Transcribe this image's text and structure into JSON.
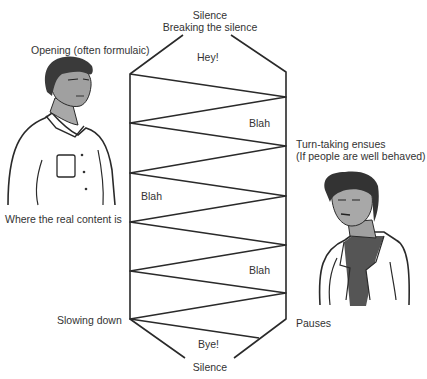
{
  "diagram": {
    "top_labels": {
      "silence": "Silence",
      "breaking": "Breaking the silence"
    },
    "left_labels": {
      "opening": "Opening (often formulaic)",
      "real_content": "Where the real content is",
      "slowing_down": "Slowing down"
    },
    "right_labels": {
      "turn_taking_line1": "Turn-taking ensues",
      "turn_taking_line2": "(If people are well behaved)",
      "pauses": "Pauses"
    },
    "utterances": {
      "hey": "Hey!",
      "blah1": "Blah",
      "blah2": "Blah",
      "blah3": "Blah",
      "bye": "Bye!"
    },
    "bottom_label": "Silence",
    "caption_fragment": "... of the conversation ...",
    "figures": {
      "left": "man-illustration",
      "right": "woman-illustration"
    },
    "colors": {
      "line": "#2a2a2a",
      "skin_shade": "#9a9a9a",
      "hair": "#3a3a3a"
    }
  }
}
